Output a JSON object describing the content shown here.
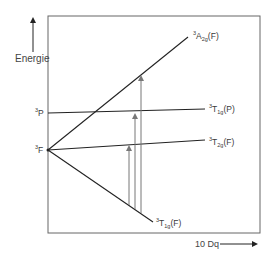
{
  "diagram": {
    "type": "energy-level-diagram (Orgel/Tanabe-Sugano style)",
    "y_axis_label": "Energie",
    "x_axis_label": "10 Dq",
    "free_ion_terms": [
      {
        "id": "3P",
        "sup": "3",
        "base": "P"
      },
      {
        "id": "3F",
        "sup": "3",
        "base": "F"
      }
    ],
    "states": [
      {
        "id": "3A2g(F)",
        "sup": "3",
        "base": "A",
        "sub": "2g",
        "suffix": "(F)",
        "origin": "3F",
        "trend": "rising steeply"
      },
      {
        "id": "3T1g(P)",
        "sup": "3",
        "base": "T",
        "sub": "1g",
        "suffix": "(P)",
        "origin": "3P",
        "trend": "nearly flat"
      },
      {
        "id": "3T2g(F)",
        "sup": "3",
        "base": "T",
        "sub": "2g",
        "suffix": "(F)",
        "origin": "3F",
        "trend": "slightly rising"
      },
      {
        "id": "3T1g(F)",
        "sup": "3",
        "base": "T",
        "sub": "1g",
        "suffix": "(F)",
        "origin": "3F",
        "trend": "falling (ground state)"
      }
    ],
    "transitions": [
      {
        "from": "3T1g(F)",
        "to": "3T2g(F)"
      },
      {
        "from": "3T1g(F)",
        "to": "3T1g(P)"
      },
      {
        "from": "3T1g(F)",
        "to": "3A2g(F)"
      }
    ],
    "colors": {
      "lines": "#222222",
      "arrows": "#777777",
      "frame": "#555555"
    }
  }
}
